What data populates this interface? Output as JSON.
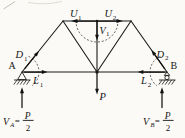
{
  "figure_type": "truss-free-body-diagram",
  "colors": {
    "background": "#fbfaf6",
    "ink": "#1b1b1b",
    "dashed_arc": "#4a4a4a"
  },
  "joints": {
    "left_support": "A",
    "right_support": "B"
  },
  "member_forces": {
    "u1": {
      "base": "U",
      "sub": "1"
    },
    "u2": {
      "base": "U",
      "sub": "2"
    },
    "v1": {
      "base": "V",
      "sub": "1"
    },
    "d1": {
      "base": "D",
      "sub": "1"
    },
    "d2": {
      "base": "D",
      "sub": "2"
    },
    "l1": {
      "base": "L",
      "sub": "1"
    },
    "l2": {
      "base": "L",
      "sub": "2"
    }
  },
  "loads": {
    "center_load": "P"
  },
  "reactions": {
    "left": {
      "base": "V",
      "sub": "A",
      "equals": "=",
      "numerator": "P",
      "denominator": "2"
    },
    "right": {
      "base": "V",
      "sub": "B",
      "equals": "=",
      "numerator": "P",
      "denominator": "2"
    }
  }
}
